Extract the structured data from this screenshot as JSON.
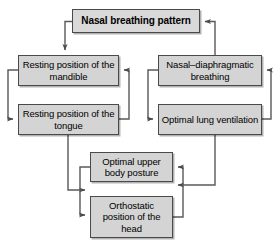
{
  "diagram": {
    "type": "flowchart",
    "style": {
      "node_fill": "#d4d4d4",
      "node_border": "#4a4a4a",
      "edge_color": "#595959",
      "background": "#ffffff",
      "text_color": "#000000"
    },
    "nodes": [
      {
        "id": "nasal-breathing-pattern",
        "label": "Nasal breathing pattern",
        "bold": true,
        "x": 72,
        "y": 9,
        "w": 128,
        "h": 24
      },
      {
        "id": "resting-position-mandible",
        "label": "Resting position of the mandible",
        "bold": false,
        "x": 18,
        "y": 55,
        "w": 101,
        "h": 31
      },
      {
        "id": "resting-position-tongue",
        "label": "Resting position of the tongue",
        "bold": false,
        "x": 18,
        "y": 104,
        "w": 101,
        "h": 31
      },
      {
        "id": "nasal-diaphragmatic-breathing",
        "label": "Nasal–diaphragmatic breathing",
        "bold": false,
        "x": 158,
        "y": 55,
        "w": 104,
        "h": 31
      },
      {
        "id": "optimal-lung-ventilation",
        "label": "Optimal lung ventilation",
        "bold": false,
        "x": 158,
        "y": 104,
        "w": 104,
        "h": 31
      },
      {
        "id": "optimal-upper-body-posture",
        "label": "Optimal upper body posture",
        "bold": false,
        "x": 90,
        "y": 152,
        "w": 83,
        "h": 30
      },
      {
        "id": "orthostatic-position-head",
        "label": "Orthostatic position of the head",
        "bold": false,
        "x": 90,
        "y": 196,
        "w": 83,
        "h": 42
      }
    ],
    "edges": [
      {
        "from": "nasal-breathing-pattern",
        "to": "resting-position-mandible"
      },
      {
        "from": "nasal-diaphragmatic-breathing",
        "to": "nasal-breathing-pattern"
      },
      {
        "from": "resting-position-mandible",
        "to": "resting-position-tongue"
      },
      {
        "from": "resting-position-tongue",
        "to": "resting-position-mandible"
      },
      {
        "from": "nasal-diaphragmatic-breathing",
        "to": "optimal-lung-ventilation"
      },
      {
        "from": "optimal-lung-ventilation",
        "to": "nasal-diaphragmatic-breathing"
      },
      {
        "from": "resting-position-tongue",
        "to": "orthostatic-position-head"
      },
      {
        "from": "optimal-lung-ventilation",
        "to": "orthostatic-position-head"
      },
      {
        "from": "optimal-upper-body-posture",
        "to": "orthostatic-position-head"
      },
      {
        "from": "orthostatic-position-head",
        "to": "optimal-upper-body-posture"
      }
    ]
  }
}
